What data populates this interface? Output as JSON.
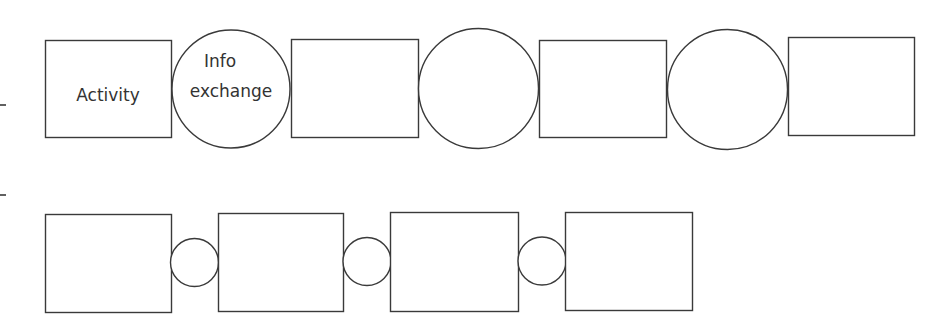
{
  "diagram": {
    "type": "process-chain",
    "rows": [
      {
        "name": "top-row",
        "description": "Activities connected by large info-exchange circles",
        "nodes": [
          {
            "kind": "activity",
            "label": "Activity"
          },
          {
            "kind": "info-exchange",
            "label_lines": [
              "Info",
              "exchange"
            ]
          },
          {
            "kind": "activity",
            "label": ""
          },
          {
            "kind": "info-exchange",
            "label_lines": []
          },
          {
            "kind": "activity",
            "label": ""
          },
          {
            "kind": "info-exchange",
            "label_lines": []
          },
          {
            "kind": "activity",
            "label": ""
          }
        ]
      },
      {
        "name": "bottom-row",
        "description": "Activities connected by small info-exchange circles",
        "nodes": [
          {
            "kind": "activity",
            "label": ""
          },
          {
            "kind": "info-exchange",
            "label_lines": []
          },
          {
            "kind": "activity",
            "label": ""
          },
          {
            "kind": "info-exchange",
            "label_lines": []
          },
          {
            "kind": "activity",
            "label": ""
          },
          {
            "kind": "info-exchange",
            "label_lines": []
          },
          {
            "kind": "activity",
            "label": ""
          }
        ]
      }
    ],
    "colors": {
      "stroke": "#3a3a3a",
      "fill": "#ffffff",
      "text": "#333333"
    }
  }
}
